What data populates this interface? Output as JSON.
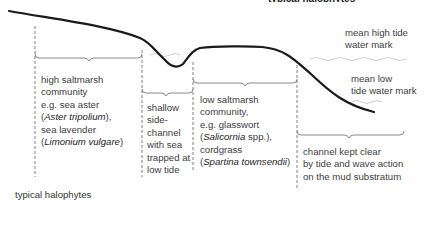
{
  "figure": {
    "top_caption_partial": "typical halophytes",
    "bottom_caption": "typical halophytes"
  },
  "water_marks": {
    "high": [
      "mean high tide",
      "water mark"
    ],
    "low": [
      "mean low",
      "tide water mark"
    ]
  },
  "zones": [
    {
      "id": "high-saltmarsh",
      "lines": [
        {
          "text": "high saltmarsh"
        },
        {
          "text": "community"
        },
        {
          "text": "e.g. sea aster"
        },
        {
          "pre": "(",
          "italic": "Aster tripolium",
          "post": "),"
        },
        {
          "text": "sea lavender"
        },
        {
          "pre": "(",
          "italic": "Limonium vulgare",
          "post": ")"
        }
      ]
    },
    {
      "id": "side-channel",
      "lines": [
        {
          "text": "shallow"
        },
        {
          "text": "side-"
        },
        {
          "text": "channel"
        },
        {
          "text": "with sea"
        },
        {
          "text": "trapped at"
        },
        {
          "text": "low tide"
        }
      ]
    },
    {
      "id": "low-saltmarsh",
      "lines": [
        {
          "text": "low saltmarsh"
        },
        {
          "text": "community,"
        },
        {
          "text": "e.g. glasswort"
        },
        {
          "pre": "(",
          "italic": "Salicornia",
          "post": " spp.),"
        },
        {
          "text": "cordgrass"
        },
        {
          "pre": "(",
          "italic": "Spartina townsendii",
          "post": ")"
        }
      ]
    },
    {
      "id": "main-channel",
      "lines": [
        {
          "text": "channel kept clear"
        },
        {
          "text": "by tide and wave action"
        },
        {
          "text": "on the mud substratum"
        }
      ]
    }
  ],
  "colors": {
    "profile_line": "#1a1a1a",
    "water_line": "#c8c8c8",
    "dashed_divider": "#6e6e6e",
    "bracket": "#7a7a7a",
    "text": "#3c3c3c"
  }
}
